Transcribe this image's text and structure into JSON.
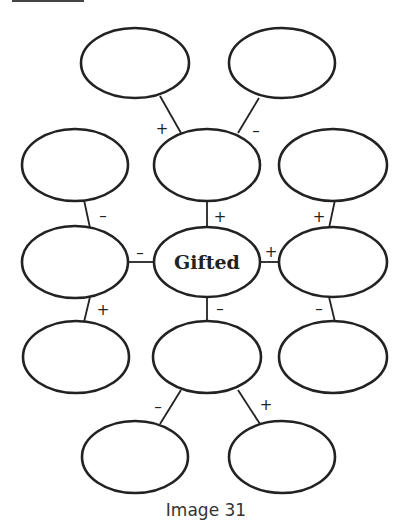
{
  "diagram": {
    "center": {
      "label": "Gifted"
    },
    "nodes": [
      {
        "id": "n-top-left",
        "cx": 135,
        "cy": 62,
        "label": ""
      },
      {
        "id": "n-top-right",
        "cx": 282,
        "cy": 62,
        "label": ""
      },
      {
        "id": "n-r2-left",
        "cx": 75,
        "cy": 165,
        "label": ""
      },
      {
        "id": "n-r2-center",
        "cx": 207,
        "cy": 165,
        "label": ""
      },
      {
        "id": "n-r2-right",
        "cx": 333,
        "cy": 165,
        "label": ""
      },
      {
        "id": "n-r3-left",
        "cx": 75,
        "cy": 262,
        "label": ""
      },
      {
        "id": "n-r3-right",
        "cx": 333,
        "cy": 262,
        "label": ""
      },
      {
        "id": "n-r4-left",
        "cx": 75,
        "cy": 357,
        "label": ""
      },
      {
        "id": "n-r4-center",
        "cx": 207,
        "cy": 357,
        "label": ""
      },
      {
        "id": "n-r4-right",
        "cx": 333,
        "cy": 357,
        "label": ""
      },
      {
        "id": "n-bot-left",
        "cx": 135,
        "cy": 457,
        "label": ""
      },
      {
        "id": "n-bot-right",
        "cx": 282,
        "cy": 457,
        "label": ""
      }
    ],
    "signs": {
      "top_left": "+",
      "top_right": "–",
      "r2_left": "–",
      "r2_center": "+",
      "r2_right": "+",
      "r3_left": "–",
      "r3_right": "+",
      "r4_left": "+",
      "r4_center": "–",
      "r4_right": "–",
      "bot_left": "–",
      "bot_right": "+"
    }
  },
  "caption": "Image 31"
}
